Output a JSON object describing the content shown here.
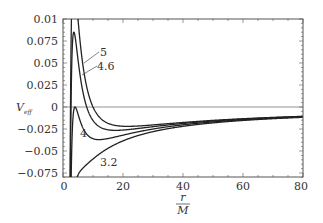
{
  "chart_data": {
    "type": "line",
    "title": "",
    "xlabel_num": "r",
    "xlabel_den": "M",
    "ylabel": "V",
    "ylabel_sub": "eff",
    "xlim": [
      0,
      80
    ],
    "ylim": [
      -0.08,
      0.1
    ],
    "xticks": [
      "0",
      "20",
      "40",
      "60",
      "80"
    ],
    "yticks": [
      "0.01",
      "0.075",
      "0.05",
      "0.025",
      "0",
      "−0.025",
      "−0.05",
      "−0.075"
    ],
    "grid": false,
    "legend": "inline curve labels",
    "formula": "V_eff = -M/r + L^2/(2 r^2) - M L^2 / r^3",
    "series": [
      {
        "name": "5",
        "L_over_M": 5
      },
      {
        "name": "4.6",
        "L_over_M": 4.6
      },
      {
        "name": "4",
        "L_over_M": 4
      },
      {
        "name": "3.2",
        "L_over_M": 3.2
      }
    ],
    "labels": {
      "s5": "5",
      "s46": "4.6",
      "s4": "4",
      "s32": "3.2"
    }
  }
}
